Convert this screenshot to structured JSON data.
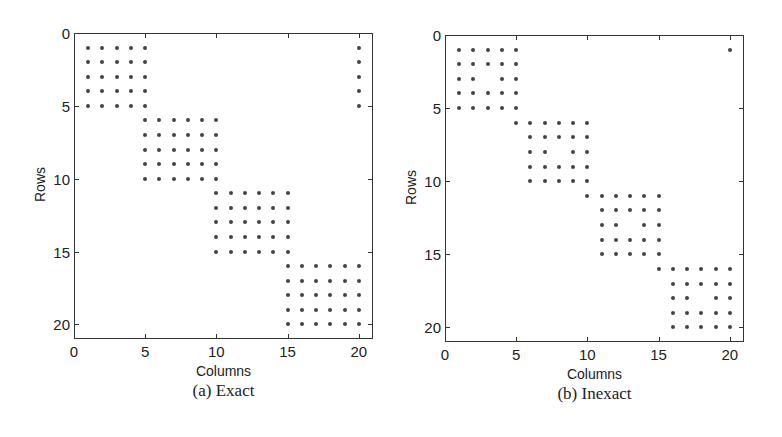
{
  "chart_data": [
    {
      "type": "scatter",
      "subtype": "sparsity-pattern",
      "caption": "(a) Exact",
      "xlabel": "Columns",
      "ylabel": "Rows",
      "xlim": [
        0,
        21
      ],
      "ylim": [
        0,
        21
      ],
      "y_inverted": true,
      "xticks": [
        0,
        5,
        10,
        15,
        20
      ],
      "yticks": [
        0,
        5,
        10,
        15,
        20
      ],
      "grid": false,
      "marker_color": "#444444",
      "frame": {
        "left": 74,
        "top": 33,
        "right": 373,
        "bottom": 339
      },
      "blocks": [
        {
          "rows": [
            1,
            5
          ],
          "cols": [
            1,
            5
          ]
        },
        {
          "rows": [
            6,
            10
          ],
          "cols": [
            5,
            10
          ]
        },
        {
          "rows": [
            11,
            15
          ],
          "cols": [
            10,
            15
          ]
        },
        {
          "rows": [
            16,
            20
          ],
          "cols": [
            15,
            20
          ]
        },
        {
          "rows": [
            1,
            5
          ],
          "cols": [
            20,
            20
          ]
        }
      ],
      "missing": []
    },
    {
      "type": "scatter",
      "subtype": "sparsity-pattern",
      "caption": "(b) Inexact",
      "xlabel": "Columns",
      "ylabel": "Rows",
      "xlim": [
        0,
        21
      ],
      "ylim": [
        0,
        21
      ],
      "y_inverted": true,
      "xticks": [
        0,
        5,
        10,
        15,
        20
      ],
      "yticks": [
        0,
        5,
        10,
        15,
        20
      ],
      "grid": false,
      "marker_color": "#444444",
      "frame": {
        "left": 445,
        "top": 35,
        "right": 744,
        "bottom": 342
      },
      "blocks": [
        {
          "rows": [
            1,
            5
          ],
          "cols": [
            1,
            5
          ]
        },
        {
          "rows": [
            6,
            6
          ],
          "cols": [
            5,
            10
          ]
        },
        {
          "rows": [
            7,
            10
          ],
          "cols": [
            6,
            10
          ]
        },
        {
          "rows": [
            11,
            11
          ],
          "cols": [
            10,
            15
          ]
        },
        {
          "rows": [
            12,
            15
          ],
          "cols": [
            11,
            15
          ]
        },
        {
          "rows": [
            16,
            16
          ],
          "cols": [
            15,
            20
          ]
        },
        {
          "rows": [
            17,
            20
          ],
          "cols": [
            16,
            20
          ]
        },
        {
          "rows": [
            1,
            1
          ],
          "cols": [
            20,
            20
          ]
        }
      ],
      "missing": [
        [
          3,
          3
        ],
        [
          8,
          8
        ],
        [
          13,
          13
        ],
        [
          18,
          18
        ]
      ]
    }
  ],
  "panels": [
    {
      "caption": "(a) Exact",
      "xlabel": "Columns",
      "ylabel": "Rows"
    },
    {
      "caption": "(b) Inexact",
      "xlabel": "Columns",
      "ylabel": "Rows"
    }
  ]
}
